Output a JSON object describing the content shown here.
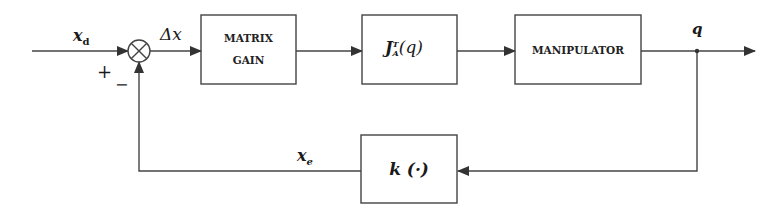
{
  "diagram": {
    "type": "block-diagram",
    "signals": {
      "input": "x",
      "input_sub": "d",
      "error": "Δx",
      "output": "q",
      "feedback": "x",
      "feedback_sub": "e"
    },
    "signs": {
      "plus": "+",
      "minus": "−"
    },
    "blocks": [
      {
        "id": "matrix-gain",
        "line1": "MATRIX",
        "line2": "GAIN"
      },
      {
        "id": "jacobian-transpose",
        "base": "J",
        "sup": "T",
        "sub": "A",
        "arg": "(q)"
      },
      {
        "id": "manipulator",
        "label": "MANIPULATOR"
      },
      {
        "id": "direct-kinematics",
        "label": "k (·)"
      }
    ],
    "colors": {
      "line": "#333333",
      "background": "#ffffff"
    }
  }
}
